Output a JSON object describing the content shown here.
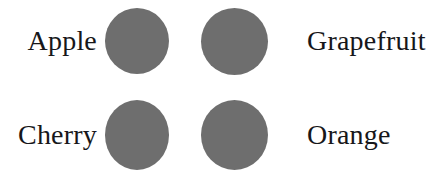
{
  "diagram": {
    "background_color": "#ffffff",
    "circle_color": "#6e6e6e",
    "text_color": "#17171a",
    "rows": [
      {
        "left_label": "Apple",
        "right_label": "Grapefruit",
        "left_circle_name": "apple",
        "right_circle_name": "grapefruit"
      },
      {
        "left_label": "Cherry",
        "right_label": "Orange",
        "left_circle_name": "cherry",
        "right_circle_name": "orange"
      }
    ]
  },
  "labels": {
    "apple": "Apple",
    "grapefruit": "Grapefruit",
    "cherry": "Cherry",
    "orange": "Orange"
  }
}
